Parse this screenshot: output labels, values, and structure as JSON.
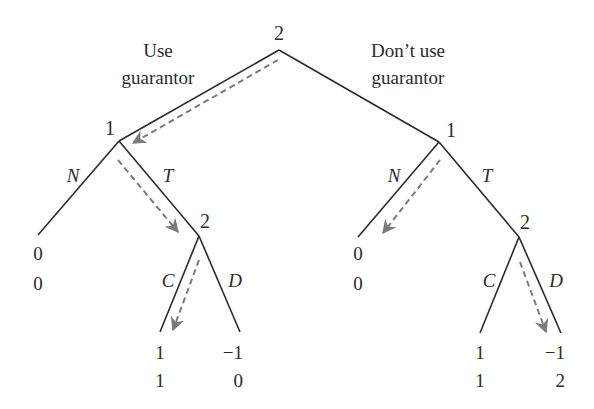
{
  "diagram": {
    "type": "game-tree",
    "root": {
      "player": "2",
      "x": 279,
      "y": 50
    },
    "branch_labels": {
      "left": [
        "Use",
        "guarantor"
      ],
      "right": [
        "Don’t use",
        "guarantor"
      ]
    },
    "nodes": {
      "left_1": {
        "player": "1",
        "x": 119,
        "y": 141
      },
      "right_1": {
        "player": "1",
        "x": 439,
        "y": 142
      },
      "left_2": {
        "player": "2",
        "x": 199,
        "y": 236
      },
      "right_2": {
        "player": "2",
        "x": 519,
        "y": 237
      }
    },
    "actions": {
      "left_N": "N",
      "left_T": "T",
      "left_C": "C",
      "left_D": "D",
      "right_N": "N",
      "right_T": "T",
      "right_C": "C",
      "right_D": "D"
    },
    "payoffs": {
      "left_N": [
        "0",
        "0"
      ],
      "left_C": [
        "1",
        "1"
      ],
      "left_D": [
        "−1",
        "0"
      ],
      "right_N": [
        "0",
        "0"
      ],
      "right_C": [
        "1",
        "1"
      ],
      "right_D": [
        "−1",
        "2"
      ]
    },
    "equilibrium_path_color": "#7a7a7a",
    "edge_color": "#2b2b2b"
  }
}
